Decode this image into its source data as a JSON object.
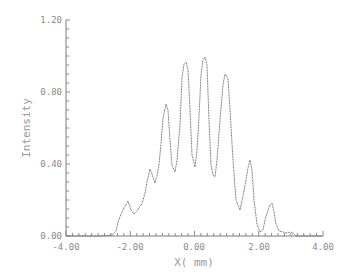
{
  "chart_data": {
    "type": "line",
    "title": "",
    "xlabel": "X( mm)",
    "ylabel": "Intensity",
    "xlim": [
      -4.0,
      4.0
    ],
    "ylim": [
      0.0,
      1.2
    ],
    "x_ticks": [
      "-4.00",
      "-2.00",
      "0.00",
      "2.00",
      "4.00"
    ],
    "y_ticks": [
      "0.00",
      "0.40",
      "0.80",
      "1.20"
    ],
    "grid": false,
    "legend": null,
    "series": [
      {
        "name": "Intensity",
        "x": [
          -4.0,
          -1.8,
          -1.0,
          -0.9,
          -0.8,
          -0.7,
          -0.55,
          -0.4,
          -0.3,
          -0.2,
          -0.1,
          0.0,
          0.1,
          0.2,
          0.3,
          0.4,
          0.5,
          0.6,
          0.75,
          0.9,
          1.0,
          1.1,
          1.25,
          1.42,
          1.55,
          1.65,
          1.73,
          1.82,
          1.95,
          2.1,
          2.2,
          2.3,
          2.42,
          2.52,
          2.65,
          2.8,
          3.0,
          3.1,
          4.0
        ],
        "y": [
          0.0,
          0.0,
          0.02,
          0.04,
          0.08,
          0.1,
          0.2,
          0.14,
          0.16,
          0.22,
          0.3,
          0.37,
          0.3,
          0.25,
          0.45,
          0.74,
          0.62,
          0.36,
          0.55,
          0.95,
          0.97,
          0.6,
          0.38,
          0.55,
          0.99,
          0.8,
          0.33,
          0.6,
          0.9,
          0.6,
          0.14,
          0.25,
          0.42,
          0.2,
          0.04,
          0.02,
          0.05,
          0.18,
          0.0
        ]
      }
    ],
    "peaks": [
      {
        "x": -2.4,
        "y": 0.21
      },
      {
        "x": -1.62,
        "y": 0.37
      },
      {
        "x": -1.07,
        "y": 0.75
      },
      {
        "x": -0.29,
        "y": 0.97
      },
      {
        "x": 0.36,
        "y": 0.99
      },
      {
        "x": 1.02,
        "y": 0.9
      },
      {
        "x": 1.73,
        "y": 0.42
      },
      {
        "x": 2.42,
        "y": 0.18
      }
    ]
  },
  "plot": {
    "origin_px": [
      66,
      236
    ],
    "x_end_px": 323,
    "y_top_px": 20,
    "curve_points": "66,236 100,236 112,235 116,231 118,222 121,214 124,208 128,201 131,210 134,214 137,211 140,206 142,204 145,193 147,182 150,169 152,174 155,183 157,176 159,165 161,144 163,118 166,104 168,110 170,140 172,165 175,172 177,160 180,125 182,78 184,64 186,62 188,70 190,110 192,155 195,167 197,150 199,117 201,75 203,60 205,57 207,65 209,120 211,165 213,175 215,177 217,160 220,120 223,85 225,74 228,78 230,110 233,160 236,200 240,210 243,196 246,180 248,168 250,160 252,170 254,200 257,224 260,232 263,230 265,220 268,210 270,205 272,203 274,212 276,224 279,231 283,232 287,233 291,232 294,234 296,236 300,236 323,236"
  }
}
